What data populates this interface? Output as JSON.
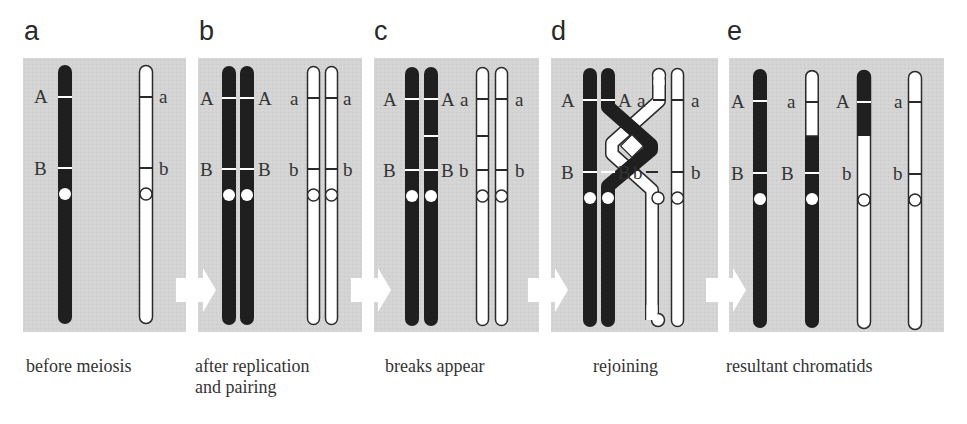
{
  "figure": {
    "colors": {
      "panel_bg": "#d4d4d4",
      "dark_chromosome": "#1f1f1f",
      "light_chromosome": "#ffffff",
      "outline": "#2a2a2a",
      "arrow": "#ffffff",
      "text": "#333333"
    },
    "alleles": {
      "dominant_top": "A",
      "dominant_bottom": "B",
      "recessive_top": "a",
      "recessive_bottom": "b"
    },
    "panels": [
      {
        "letter": "a",
        "caption_line1": "before meiosis",
        "caption_line2": ""
      },
      {
        "letter": "b",
        "caption_line1": "after replication",
        "caption_line2": "and pairing"
      },
      {
        "letter": "c",
        "caption_line1": "breaks appear",
        "caption_line2": ""
      },
      {
        "letter": "d",
        "caption_line1": "rejoining",
        "caption_line2": ""
      },
      {
        "letter": "e",
        "caption_line1": "resultant chromatids",
        "caption_line2": ""
      }
    ],
    "panel_e_chromatids": [
      {
        "top": "A",
        "bottom": "B",
        "type": "parental-dark"
      },
      {
        "top": "a",
        "bottom": "B",
        "type": "recombinant"
      },
      {
        "top": "A",
        "bottom": "b",
        "type": "recombinant"
      },
      {
        "top": "a",
        "bottom": "b",
        "type": "parental-light"
      }
    ]
  }
}
